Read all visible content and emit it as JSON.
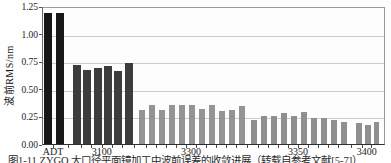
{
  "figure": {
    "y_axis_title": "波前RMS/nm",
    "caption": "图1-11 ZYGO 大口径平面镜加工中波前误差的收敛进展（转载自参考文献[5-7]）"
  },
  "chart_data": {
    "type": "bar",
    "title": "",
    "xlabel": "",
    "ylabel": "波前RMS/nm",
    "ylim": [
      0,
      1.25
    ],
    "yticks": [
      0,
      0.25,
      0.5,
      0.75,
      1.0,
      1.25
    ],
    "ytick_labels": [
      "0.00",
      "0.25",
      "0.50",
      "0.75",
      "1.00",
      "1.25"
    ],
    "grid": true,
    "legend": "none",
    "categories": [
      "ADT",
      "3100",
      "3300",
      "3350",
      "3400"
    ],
    "groups": [
      {
        "category": "ADT",
        "color": "#171717",
        "values": [
          1.19,
          1.19
        ]
      },
      {
        "category": "3100",
        "color": "#3c3c3c",
        "values": [
          0.72,
          0.67,
          0.69,
          0.71,
          0.66,
          0.73
        ]
      },
      {
        "category": "3300",
        "color": "#949494",
        "values": [
          0.31,
          0.35,
          0.31,
          0.35,
          0.35,
          0.35,
          0.32,
          0.35,
          0.3,
          0.31,
          0.34
        ]
      },
      {
        "category": "3350",
        "color": "#8f8f8f",
        "values": [
          0.22,
          0.25,
          0.25,
          0.28,
          0.25,
          0.29,
          0.24,
          0.24,
          0.22,
          0.2
        ]
      },
      {
        "category": "3400",
        "color": "#8f8f8f",
        "values": [
          0.19,
          0.17,
          0.2
        ]
      }
    ]
  }
}
